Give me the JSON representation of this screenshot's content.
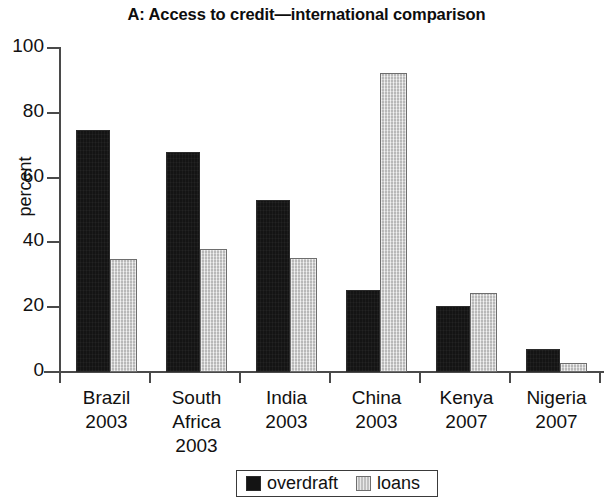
{
  "chart_data": {
    "type": "bar",
    "title": "A: Access to credit—international comparison",
    "xlabel": "",
    "ylabel": "percent",
    "ylim": [
      0,
      100
    ],
    "yticks": [
      0,
      20,
      40,
      60,
      80,
      100
    ],
    "grid": false,
    "legend_position": "bottom-center",
    "categories": [
      {
        "name": "Brazil",
        "year": "2003"
      },
      {
        "name": "South",
        "name2": "Africa",
        "year": "2003"
      },
      {
        "name": "India",
        "year": "2003"
      },
      {
        "name": "China",
        "year": "2003"
      },
      {
        "name": "Kenya",
        "year": "2007"
      },
      {
        "name": "Nigeria",
        "year": "2007"
      }
    ],
    "category_labels": [
      "Brazil 2003",
      "South Africa 2003",
      "India 2003",
      "China 2003",
      "Kenya 2007",
      "Nigeria 2007"
    ],
    "series": [
      {
        "name": "overdraft",
        "color": "#141414",
        "values": [
          74.7,
          67.9,
          53.1,
          25.3,
          20.5,
          7.2
        ]
      },
      {
        "name": "loans",
        "color": "#d2d2d2",
        "values": [
          34.9,
          38.0,
          35.2,
          92.3,
          24.4,
          2.8
        ]
      }
    ]
  },
  "legend": {
    "items": [
      {
        "label": "overdraft"
      },
      {
        "label": "loans"
      }
    ]
  }
}
